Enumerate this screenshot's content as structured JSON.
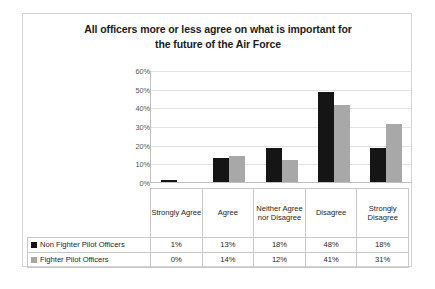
{
  "chart_data": {
    "type": "bar",
    "title": "All officers more or less agree on what is important for the future of the Air Force",
    "title_line1": "All officers more or less agree on what is important for",
    "title_line2": "the future of the Air Force",
    "xlabel": "",
    "ylabel": "",
    "ylim": [
      0,
      60
    ],
    "y_unit": "%",
    "grid": true,
    "legend_position": "bottom-table",
    "categories": [
      "Strongly Agree",
      "Agree",
      "Neither Agree nor Disagree",
      "Disagree",
      "Strongly Disagree"
    ],
    "y_ticks": [
      "0%",
      "10%",
      "20%",
      "30%",
      "40%",
      "50%",
      "60%"
    ],
    "y_tick_values": [
      0,
      10,
      20,
      30,
      40,
      50,
      60
    ],
    "series": [
      {
        "name": "Non Fighter Pilot Officers",
        "color": "#151515",
        "values": [
          1,
          13,
          18,
          48,
          18
        ],
        "labels": [
          "1%",
          "13%",
          "18%",
          "48%",
          "18%"
        ]
      },
      {
        "name": "Fighter Pilot Officers",
        "color": "#a8a8a8",
        "values": [
          0,
          14,
          12,
          41,
          31
        ],
        "labels": [
          "0%",
          "14%",
          "12%",
          "41%",
          "31%"
        ]
      }
    ]
  },
  "table": {
    "header_blank": "",
    "category_labels": [
      "Strongly Agree",
      "Agree",
      "Neither Agree nor Disagree",
      "Disagree",
      "Strongly Disagree"
    ],
    "rows": [
      {
        "label": "Non Fighter Pilot Officers",
        "swatch": "#151515",
        "values": [
          "1%",
          "13%",
          "18%",
          "48%",
          "18%"
        ]
      },
      {
        "label": "Fighter Pilot Officers",
        "swatch": "#a8a8a8",
        "values": [
          "0%",
          "14%",
          "12%",
          "41%",
          "31%"
        ]
      }
    ]
  }
}
